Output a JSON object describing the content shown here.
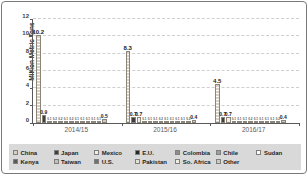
{
  "chart_data": {
    "type": "bar",
    "title": "",
    "ylabel": "Million Metric Tons",
    "xlabel": "",
    "ylim": [
      0,
      12
    ],
    "yticks": [
      0,
      2,
      4,
      6,
      8,
      10,
      12
    ],
    "grid": "horizontal-dashed",
    "legend_position": "bottom",
    "legend_bg": "#d9d9d9",
    "categories": [
      "2014/15",
      "2015/16",
      "2016/17"
    ],
    "series": [
      {
        "name": "China",
        "color": "#d8d1c3",
        "pattern": "hstripe",
        "values": [
          10.2,
          8.3,
          4.5
        ]
      },
      {
        "name": "Japan",
        "color": "#3f3f3f",
        "pattern": "solid",
        "values": [
          0.9,
          0.7,
          0.7
        ]
      },
      {
        "name": "Mexico",
        "color": "#f2efe8",
        "pattern": "solid",
        "values": [
          0.1,
          0.7,
          0.7
        ]
      },
      {
        "name": "E.U.",
        "color": "#262626",
        "pattern": "solid",
        "values": [
          0.2,
          0.1,
          0.1
        ]
      },
      {
        "name": "Colombia",
        "color": "#8c8c8c",
        "pattern": "solid",
        "values": [
          0.2,
          0.1,
          0.1
        ]
      },
      {
        "name": "Chile",
        "color": "#a0a0a0",
        "pattern": "solid",
        "values": [
          0.1,
          0.1,
          0.1
        ]
      },
      {
        "name": "Sudan",
        "color": "#fdfdfa",
        "pattern": "solid",
        "values": [
          0.2,
          0.2,
          0.2
        ]
      },
      {
        "name": "Kenya",
        "color": "#595959",
        "pattern": "solid",
        "values": [
          0.1,
          0.1,
          0.1
        ]
      },
      {
        "name": "Taiwan",
        "color": "#c4c0b6",
        "pattern": "solid",
        "values": [
          0.1,
          0.1,
          0.1
        ]
      },
      {
        "name": "U.S.",
        "color": "#707070",
        "pattern": "solid",
        "values": [
          0.1,
          0.1,
          0.1
        ]
      },
      {
        "name": "Pakistan",
        "color": "#e6e1d4",
        "pattern": "solid",
        "values": [
          0.1,
          0.1,
          0.1
        ]
      },
      {
        "name": "So. Africa",
        "color": "#f0ede4",
        "pattern": "solid",
        "values": [
          0.1,
          0.2,
          0.2
        ]
      },
      {
        "name": "Other",
        "color": "#cfcabf",
        "pattern": "hstripe",
        "values": [
          0.5,
          0.4,
          0.4
        ]
      }
    ]
  }
}
